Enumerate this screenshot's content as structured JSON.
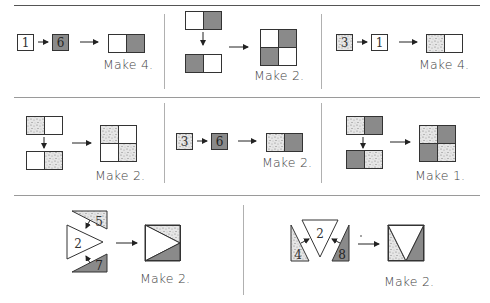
{
  "header": {
    "partial_title": "...ng diagram..."
  },
  "colors": {
    "dark": "#8a8a8a",
    "stroke": "#333333",
    "speckle_bg": "#e4e4e4",
    "divider": "#9a9a9a"
  },
  "steps": [
    {
      "id": "step1",
      "inputs": [
        "1",
        "6"
      ],
      "input_fills": [
        "white",
        "dark"
      ],
      "result": "white-dark pair",
      "caption": "Make 4."
    },
    {
      "id": "step2",
      "result": "four-patch white/dark",
      "caption": "Make 2."
    },
    {
      "id": "step3",
      "inputs": [
        "3",
        "1"
      ],
      "input_fills": [
        "speckle",
        "white"
      ],
      "result": "speckle-white pair",
      "caption": "Make 4."
    },
    {
      "id": "step4",
      "result": "four-patch speckle/white",
      "caption": "Make 2."
    },
    {
      "id": "step5",
      "inputs": [
        "3",
        "6"
      ],
      "input_fills": [
        "speckle",
        "dark"
      ],
      "result": "speckle-dark pair",
      "caption": "Make 2."
    },
    {
      "id": "step6",
      "result": "four-patch speckle/dark",
      "caption": "Make 1."
    },
    {
      "id": "step7",
      "inputs": [
        "5",
        "2",
        "7"
      ],
      "input_fills": [
        "speckle",
        "white",
        "dark"
      ],
      "result": "flying-geese style square",
      "caption": "Make 2."
    },
    {
      "id": "step8",
      "inputs": [
        "4",
        "2",
        "8"
      ],
      "input_fills": [
        "speckle",
        "white",
        "dark"
      ],
      "result": "triangle square",
      "caption": "Make 2."
    }
  ]
}
